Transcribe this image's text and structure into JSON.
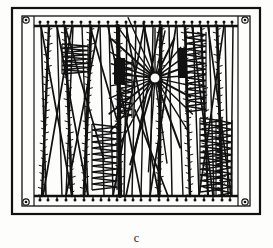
{
  "figure": {
    "caption": "c",
    "label_name": "figure-panel-label",
    "background_color": "#fdfdfc",
    "ink_color": "#111111"
  },
  "frame": {
    "outer": {
      "x": 12,
      "y": 8,
      "width": 248,
      "height": 206,
      "stroke_width": 2.2
    },
    "inner": {
      "x": 22,
      "y": 16,
      "width": 228,
      "height": 190,
      "stroke_width": 1.3
    },
    "corner_fasteners": [
      {
        "name": "screw-top-left",
        "cx": 26,
        "cy": 20,
        "r": 3.2
      },
      {
        "name": "screw-top-right",
        "cx": 245,
        "cy": 20,
        "r": 3.2
      },
      {
        "name": "screw-bottom-left",
        "cx": 26,
        "cy": 202,
        "r": 3.2
      },
      {
        "name": "screw-bottom-right",
        "cx": 245,
        "cy": 202,
        "r": 3.2
      }
    ],
    "rails": [
      {
        "name": "top-rail",
        "x1": 34,
        "y1": 26,
        "x2": 238,
        "y2": 26,
        "stroke_width": 2.4
      },
      {
        "name": "bottom-rail",
        "x1": 34,
        "y1": 196,
        "x2": 238,
        "y2": 196,
        "stroke_width": 2.4
      }
    ],
    "rail_posts": [
      {
        "name": "post-left",
        "x1": 34,
        "y1": 16,
        "x2": 34,
        "y2": 206
      },
      {
        "name": "post-right",
        "x1": 238,
        "y1": 16,
        "x2": 238,
        "y2": 206
      }
    ]
  },
  "attachment_knots": {
    "top_y": 22,
    "bottom_y": 200,
    "radius": 1.5,
    "top_x": [
      40,
      48,
      56,
      64,
      72,
      81,
      90,
      99,
      108,
      117,
      126,
      135,
      144,
      152,
      160,
      168,
      176,
      184,
      192,
      200,
      208,
      216,
      224,
      232
    ],
    "bottom_x": [
      40,
      48,
      57,
      66,
      75,
      84,
      93,
      101,
      109,
      117,
      125,
      133,
      141,
      150,
      159,
      168,
      177,
      186,
      195,
      204,
      213,
      222,
      230
    ]
  },
  "strands": {
    "vertical": [
      {
        "name": "strand-1",
        "x_top": 41,
        "x_bottom": 46,
        "barbed": false,
        "width": 1.6
      },
      {
        "name": "strand-2",
        "x_top": 49,
        "x_bottom": 42,
        "barbed": true,
        "width": 2.4
      },
      {
        "name": "strand-3",
        "x_top": 57,
        "x_bottom": 62,
        "barbed": false,
        "width": 1.4
      },
      {
        "name": "strand-4",
        "x_top": 65,
        "x_bottom": 72,
        "barbed": true,
        "width": 2.6
      },
      {
        "name": "strand-5",
        "x_top": 73,
        "x_bottom": 66,
        "barbed": false,
        "width": 1.5
      },
      {
        "name": "strand-6",
        "x_top": 82,
        "x_bottom": 88,
        "barbed": false,
        "width": 1.4
      },
      {
        "name": "strand-7",
        "x_top": 91,
        "x_bottom": 84,
        "barbed": true,
        "width": 3.0
      },
      {
        "name": "strand-8",
        "x_top": 100,
        "x_bottom": 104,
        "barbed": false,
        "width": 1.5
      },
      {
        "name": "strand-9",
        "x_top": 109,
        "x_bottom": 113,
        "barbed": false,
        "width": 1.4
      },
      {
        "name": "strand-10",
        "x_top": 118,
        "x_bottom": 120,
        "barbed": true,
        "width": 4.2
      },
      {
        "name": "strand-11",
        "x_top": 127,
        "x_bottom": 124,
        "barbed": false,
        "width": 1.6
      },
      {
        "name": "strand-12",
        "x_top": 136,
        "x_bottom": 132,
        "barbed": false,
        "width": 1.5
      },
      {
        "name": "strand-13",
        "x_top": 145,
        "x_bottom": 141,
        "barbed": false,
        "width": 1.4
      },
      {
        "name": "strand-14",
        "x_top": 153,
        "x_bottom": 150,
        "barbed": false,
        "width": 1.5
      },
      {
        "name": "strand-15",
        "x_top": 161,
        "x_bottom": 159,
        "barbed": true,
        "width": 3.4
      },
      {
        "name": "strand-16",
        "x_top": 169,
        "x_bottom": 172,
        "barbed": false,
        "width": 1.5
      },
      {
        "name": "strand-17",
        "x_top": 177,
        "x_bottom": 183,
        "barbed": false,
        "width": 1.4
      },
      {
        "name": "strand-18",
        "x_top": 185,
        "x_bottom": 190,
        "barbed": true,
        "width": 2.6
      },
      {
        "name": "strand-19",
        "x_top": 193,
        "x_bottom": 199,
        "barbed": false,
        "width": 1.5
      },
      {
        "name": "strand-20",
        "x_top": 201,
        "x_bottom": 208,
        "barbed": true,
        "width": 2.2
      },
      {
        "name": "strand-21",
        "x_top": 209,
        "x_bottom": 214,
        "barbed": false,
        "width": 1.4
      },
      {
        "name": "strand-22",
        "x_top": 217,
        "x_bottom": 222,
        "barbed": true,
        "width": 2.8
      },
      {
        "name": "strand-23",
        "x_top": 225,
        "x_bottom": 228,
        "barbed": false,
        "width": 1.5
      },
      {
        "name": "strand-24",
        "x_top": 233,
        "x_bottom": 231,
        "barbed": false,
        "width": 1.5
      }
    ],
    "diagonals": [
      {
        "name": "diagonal-1",
        "x1": 41,
        "y1": 26,
        "x2": 72,
        "y2": 196
      },
      {
        "name": "diagonal-2",
        "x1": 72,
        "y1": 26,
        "x2": 43,
        "y2": 196
      },
      {
        "name": "diagonal-3",
        "x1": 57,
        "y1": 26,
        "x2": 88,
        "y2": 196
      },
      {
        "name": "diagonal-4",
        "x1": 99,
        "y1": 26,
        "x2": 66,
        "y2": 196
      },
      {
        "name": "diagonal-5",
        "x1": 65,
        "y1": 26,
        "x2": 104,
        "y2": 160
      },
      {
        "name": "diagonal-6",
        "x1": 108,
        "y1": 26,
        "x2": 141,
        "y2": 196
      },
      {
        "name": "diagonal-7",
        "x1": 144,
        "y1": 26,
        "x2": 113,
        "y2": 196
      },
      {
        "name": "diagonal-8",
        "x1": 126,
        "y1": 26,
        "x2": 159,
        "y2": 196
      },
      {
        "name": "diagonal-9",
        "x1": 160,
        "y1": 26,
        "x2": 126,
        "y2": 196
      },
      {
        "name": "diagonal-10",
        "x1": 176,
        "y1": 26,
        "x2": 150,
        "y2": 196
      },
      {
        "name": "diagonal-11",
        "x1": 192,
        "y1": 26,
        "x2": 213,
        "y2": 196
      },
      {
        "name": "diagonal-12",
        "x1": 224,
        "y1": 26,
        "x2": 199,
        "y2": 196
      },
      {
        "name": "diagonal-13",
        "x1": 208,
        "y1": 26,
        "x2": 231,
        "y2": 196
      },
      {
        "name": "diagonal-14",
        "x1": 90,
        "y1": 26,
        "x2": 117,
        "y2": 120
      },
      {
        "name": "diagonal-15",
        "x1": 135,
        "y1": 110,
        "x2": 168,
        "y2": 196
      }
    ]
  },
  "hub": {
    "name": "central-radial-hub",
    "cx": 155,
    "cy": 78,
    "core_radius": 5.0,
    "ring_radius": 6.6,
    "spokes": [
      {
        "angle_deg": 186,
        "length": 42
      },
      {
        "angle_deg": 198,
        "length": 46
      },
      {
        "angle_deg": 210,
        "length": 52
      },
      {
        "angle_deg": 222,
        "length": 58
      },
      {
        "angle_deg": 234,
        "length": 62
      },
      {
        "angle_deg": 246,
        "length": 66
      },
      {
        "angle_deg": 258,
        "length": 56
      },
      {
        "angle_deg": 270,
        "length": 50
      },
      {
        "angle_deg": 282,
        "length": 48
      },
      {
        "angle_deg": 296,
        "length": 44
      },
      {
        "angle_deg": 310,
        "length": 40
      },
      {
        "angle_deg": 324,
        "length": 36
      },
      {
        "angle_deg": 340,
        "length": 34
      },
      {
        "angle_deg": 356,
        "length": 32
      },
      {
        "angle_deg": 12,
        "length": 34
      },
      {
        "angle_deg": 28,
        "length": 40
      },
      {
        "angle_deg": 44,
        "length": 52
      },
      {
        "angle_deg": 58,
        "length": 64
      },
      {
        "angle_deg": 70,
        "length": 74
      },
      {
        "angle_deg": 82,
        "length": 86
      },
      {
        "angle_deg": 94,
        "length": 94
      },
      {
        "angle_deg": 106,
        "length": 90
      },
      {
        "angle_deg": 118,
        "length": 80
      },
      {
        "angle_deg": 130,
        "length": 70
      },
      {
        "angle_deg": 142,
        "length": 58
      },
      {
        "angle_deg": 156,
        "length": 50
      },
      {
        "angle_deg": 170,
        "length": 44
      }
    ]
  },
  "zigzag_panels": [
    {
      "name": "zigzag-left-upper",
      "x_left": 62,
      "x_right": 88,
      "y_top": 44,
      "y_bottom": 74,
      "rungs": 7
    },
    {
      "name": "zigzag-left-lower",
      "x_left": 92,
      "x_right": 117,
      "y_top": 124,
      "y_bottom": 190,
      "rungs": 11
    },
    {
      "name": "zigzag-center",
      "x_left": 118,
      "x_right": 132,
      "y_top": 60,
      "y_bottom": 118,
      "rungs": 10
    },
    {
      "name": "zigzag-right-upper",
      "x_left": 186,
      "x_right": 206,
      "y_top": 32,
      "y_bottom": 112,
      "rungs": 14
    },
    {
      "name": "zigzag-right-lower",
      "x_left": 200,
      "x_right": 222,
      "y_top": 118,
      "y_bottom": 192,
      "rungs": 13
    },
    {
      "name": "zigzag-far-right",
      "x_left": 216,
      "x_right": 232,
      "y_top": 120,
      "y_bottom": 196,
      "rungs": 12
    }
  ],
  "dark_blocks": [
    {
      "name": "dark-block-center",
      "x": 114,
      "y": 58,
      "width": 11,
      "height": 26
    },
    {
      "name": "dark-block-right",
      "x": 178,
      "y": 48,
      "width": 8,
      "height": 30
    }
  ]
}
